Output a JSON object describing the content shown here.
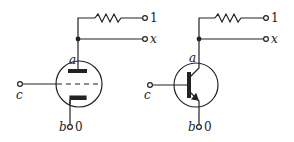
{
  "diagram": {
    "title": "",
    "circuits": [
      {
        "id": "vacuum-tube-circuit",
        "device": "triode vacuum tube",
        "labels": {
          "anode": "a",
          "input": "c",
          "ground_node": "b",
          "ground_value": "0",
          "supply_value": "1",
          "output": "x"
        }
      },
      {
        "id": "transistor-circuit",
        "device": "NPN transistor",
        "labels": {
          "anode": "a",
          "input": "c",
          "ground_node": "b",
          "ground_value": "0",
          "supply_value": "1",
          "output": "x"
        }
      }
    ],
    "colors": {
      "ink": "#222222",
      "background": "#ffffff"
    }
  }
}
